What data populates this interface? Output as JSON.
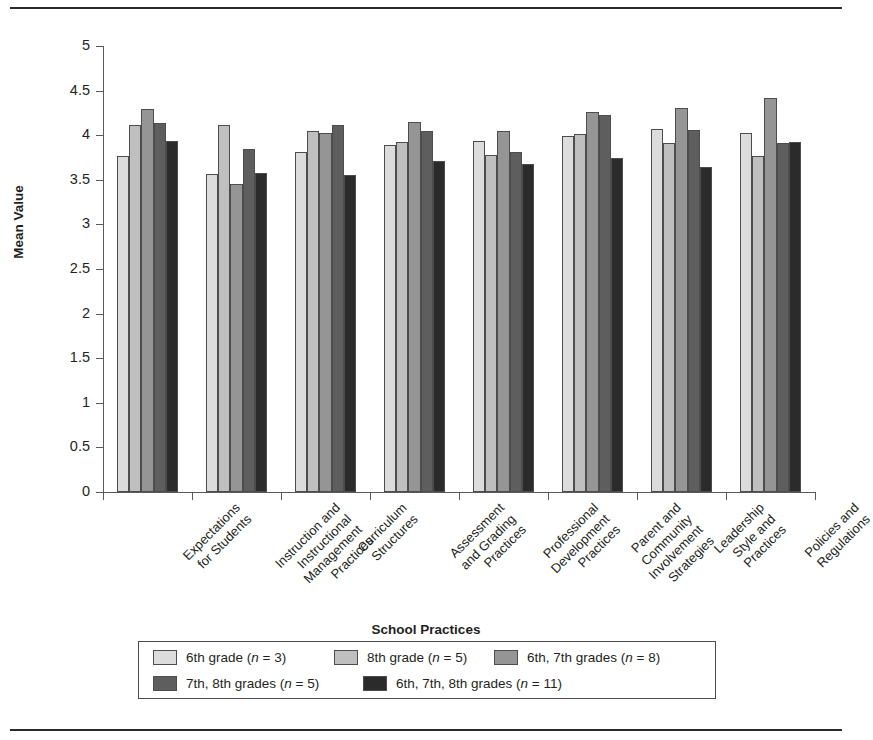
{
  "chart_data": {
    "type": "bar",
    "title": "",
    "xlabel": "School Practices",
    "ylabel": "Mean Value",
    "ylim": [
      0,
      5
    ],
    "ytick_step": 0.5,
    "yticks": [
      "5",
      "4.5",
      "4",
      "3.5",
      "3",
      "2.5",
      "2",
      "1.5",
      "1",
      "0.5",
      "0"
    ],
    "grid": false,
    "legend_position": "bottom",
    "categories": [
      "Expectations\nfor Students",
      "Instruction and\nInstructional\nManagement\nPractices",
      "Curriculum\nStructures",
      "Assessment\nand Grading\nPractices",
      "Professional\nDevelopment\nPractices",
      "Parent and\nCommunity\nInvolvement\nStrategies",
      "Leadership\nStyle and\nPractices",
      "Policies and\nRegulations"
    ],
    "series": [
      {
        "name": "6th grade (n = 3)",
        "label_main": "6th grade (",
        "label_italic": "n",
        "label_tail": " = 3)",
        "color": "#dcdcdc",
        "values": [
          3.77,
          3.56,
          3.81,
          3.89,
          3.94,
          3.99,
          4.07,
          4.02
        ]
      },
      {
        "name": "8th grade (n = 5)",
        "label_main": "8th grade (",
        "label_italic": "n",
        "label_tail": " = 5)",
        "color": "#bfbfbf",
        "values": [
          4.11,
          4.11,
          4.05,
          3.92,
          3.78,
          4.01,
          3.91,
          3.77
        ]
      },
      {
        "name": "6th, 7th grades (n = 8)",
        "label_main": "6th, 7th grades (",
        "label_italic": "n",
        "label_tail": " = 8)",
        "color": "#959595",
        "values": [
          4.29,
          3.45,
          4.02,
          4.15,
          4.05,
          4.26,
          4.31,
          4.42
        ]
      },
      {
        "name": "7th, 8th grades (n = 5)",
        "label_main": "7th, 8th grades (",
        "label_italic": "n",
        "label_tail": " = 5)",
        "color": "#5e5e5e",
        "values": [
          4.14,
          3.85,
          4.12,
          4.05,
          3.81,
          4.23,
          4.06,
          3.91
        ]
      },
      {
        "name": "6th, 7th, 8th grades (n = 11)",
        "label_main": "6th, 7th, 8th grades (",
        "label_italic": "n",
        "label_tail": " = 11)",
        "color": "#2b2b2b",
        "values": [
          3.94,
          3.58,
          3.55,
          3.71,
          3.68,
          3.74,
          3.64,
          3.92
        ]
      }
    ]
  }
}
